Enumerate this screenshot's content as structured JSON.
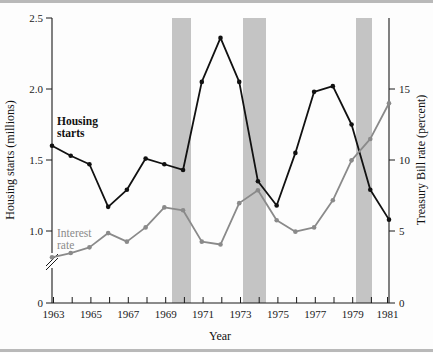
{
  "figure": {
    "background_color": "#fdfdfd",
    "band_color": "#c4c4c4",
    "housing_color": "#111111",
    "interest_color": "#8a8a8a"
  },
  "axes": {
    "x": {
      "title": "Year",
      "tick_labels": [
        "1963",
        "1965",
        "1967",
        "1969",
        "1971",
        "1973",
        "1975",
        "1977",
        "1979",
        "1981"
      ],
      "minor_years": [
        1963,
        1964,
        1965,
        1966,
        1967,
        1968,
        1969,
        1970,
        1971,
        1972,
        1973,
        1974,
        1975,
        1976,
        1977,
        1978,
        1979,
        1980,
        1981
      ],
      "range": [
        1963,
        1981
      ]
    },
    "y_left": {
      "title": "Housing starts (millions)",
      "tick_labels": [
        "2.5",
        "2.0",
        "1.5",
        "1.0",
        "0"
      ],
      "tick_values": [
        2.5,
        2.0,
        1.5,
        1.0,
        0
      ],
      "range": [
        0.75,
        2.5
      ],
      "has_axis_break": true,
      "break_symbol": "double-slash"
    },
    "y_right": {
      "title": "Treasury Bill rate (percent)",
      "tick_labels": [
        "15",
        "10",
        "5",
        "0"
      ],
      "tick_values": [
        15,
        10,
        5,
        0
      ],
      "range": [
        0,
        16.1
      ]
    }
  },
  "series_labels": {
    "housing": "Housing\nstarts",
    "housing_line1": "Housing",
    "housing_line2": "starts",
    "interest_line1": "Interest",
    "interest_line2": "rate"
  },
  "chart_data": {
    "type": "line",
    "title": "",
    "xlabel": "Year",
    "ylabel": "Housing starts (millions)",
    "y2label": "Treasury Bill rate (percent)",
    "x": [
      1963,
      1964,
      1965,
      1966,
      1967,
      1968,
      1969,
      1970,
      1971,
      1972,
      1973,
      1974,
      1975,
      1976,
      1977,
      1978,
      1979,
      1980,
      1981
    ],
    "xlim": [
      1963,
      1981
    ],
    "ylim": [
      0.75,
      2.5
    ],
    "y2lim": [
      0,
      16.1
    ],
    "grid": false,
    "legend": "inline-annotations",
    "series": [
      {
        "name": "Housing starts",
        "axis": "left",
        "units": "millions",
        "color": "#111111",
        "marker": "circle",
        "values": [
          1.6,
          1.53,
          1.47,
          1.17,
          1.29,
          1.51,
          1.47,
          1.43,
          2.05,
          2.36,
          2.05,
          1.35,
          1.18,
          1.55,
          1.98,
          2.02,
          1.75,
          1.29,
          1.08
        ]
      },
      {
        "name": "Interest rate",
        "axis": "right",
        "units": "percent",
        "color": "#8a8a8a",
        "marker": "circle",
        "values": [
          3.2,
          3.5,
          3.9,
          4.9,
          4.3,
          5.3,
          6.7,
          6.5,
          4.3,
          4.1,
          7.0,
          7.9,
          5.8,
          5.0,
          5.3,
          7.2,
          10.0,
          11.5,
          14.0
        ]
      }
    ],
    "shaded_bands": [
      {
        "label": "recession",
        "x_start": 1969.75,
        "x_end": 1970.7,
        "color": "#c4c4c4"
      },
      {
        "label": "recession",
        "x_start": 1973.3,
        "x_end": 1974.5,
        "color": "#c4c4c4"
      },
      {
        "label": "recession",
        "x_start": 1980.0,
        "x_end": 1980.85,
        "color": "#c4c4c4"
      }
    ]
  }
}
